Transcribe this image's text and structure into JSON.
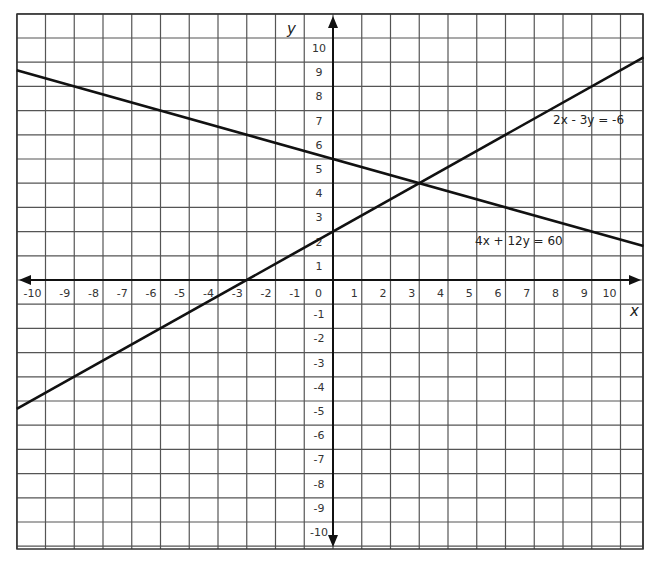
{
  "chart_data": {
    "type": "line",
    "title": "",
    "xlabel": "x",
    "ylabel": "y",
    "xlim": [
      -11,
      10.8
    ],
    "ylim": [
      -11,
      11
    ],
    "grid": true,
    "x_ticks": [
      "-10",
      "-9",
      "-8",
      "-7",
      "-6",
      "-5",
      "-4",
      "-3",
      "-2",
      "-1",
      "0",
      "1",
      "2",
      "3",
      "4",
      "5",
      "6",
      "7",
      "8",
      "9",
      "10"
    ],
    "y_ticks": [
      "10",
      "9",
      "8",
      "7",
      "6",
      "5",
      "4",
      "3",
      "2",
      "1",
      "-1",
      "-2",
      "-3",
      "-4",
      "-5",
      "-6",
      "-7",
      "-8",
      "-9",
      "-10"
    ],
    "series": [
      {
        "name": "2x - 3y = -6",
        "equation": "2x - 3y = -6",
        "slope": 0.6667,
        "intercept": 2,
        "x": [
          -11,
          10.8
        ],
        "y": [
          -5.33,
          9.2
        ]
      },
      {
        "name": "4x + 12y = 60",
        "equation": "4x + 12y = 60",
        "slope": -0.3333,
        "intercept": 5,
        "x": [
          -11,
          10.8
        ],
        "y": [
          8.67,
          1.4
        ]
      }
    ],
    "annotations": [
      {
        "text": "2x - 3y = -6",
        "x": 8.0,
        "y": 6.5
      },
      {
        "text": "4x + 12y = 60",
        "x": 5.0,
        "y": 1.7
      }
    ],
    "intersection": {
      "x": 3,
      "y": 4
    }
  },
  "labels": {
    "x_axis": "x",
    "y_axis": "y",
    "eq1": "2x - 3y = -6",
    "eq2": "4x + 12y = 60"
  }
}
